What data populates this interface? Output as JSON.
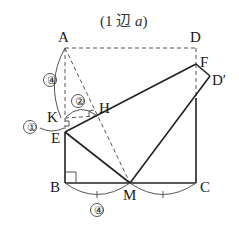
{
  "title": {
    "prefix": "(1 辺 ",
    "variable": "a",
    "suffix": ")"
  },
  "points": {
    "A": {
      "label": "A",
      "x": 65,
      "y": 48
    },
    "D": {
      "label": "D",
      "x": 196,
      "y": 48
    },
    "F": {
      "label": "F",
      "x": 196,
      "y": 64
    },
    "D_prime": {
      "label": "D′",
      "x": 210,
      "y": 76
    },
    "K": {
      "label": "K",
      "x": 63,
      "y": 118
    },
    "H": {
      "label": "H",
      "x": 97,
      "y": 116
    },
    "E": {
      "label": "E",
      "x": 65,
      "y": 132
    },
    "B": {
      "label": "B",
      "x": 65,
      "y": 183
    },
    "M": {
      "label": "M",
      "x": 130,
      "y": 183
    },
    "C": {
      "label": "C",
      "x": 196,
      "y": 183
    }
  },
  "ratio_marks": {
    "AK": "④",
    "KE": "①",
    "KH": "②",
    "BM": "④"
  },
  "line_styles": {
    "solid": [
      "E-B",
      "B-C",
      "C-F",
      "F-E",
      "E-M",
      "M-D′",
      "D′-F"
    ],
    "dashed": [
      "A-D",
      "D-F",
      "A-E",
      "A-M",
      "K-H",
      "A-H"
    ]
  },
  "right_angles": [
    "B",
    "K",
    "H"
  ],
  "colors": {
    "line": "#222222",
    "dashed": "#555555",
    "background": "#ffffff"
  }
}
